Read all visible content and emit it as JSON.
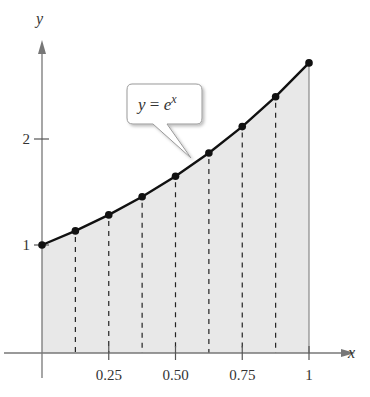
{
  "chart_data": {
    "type": "area",
    "title": "",
    "function_label": "y = e^x",
    "function_label_parts": {
      "lhs": "y",
      "eq": " = ",
      "base": "e",
      "exp": "x"
    },
    "xlabel": "x",
    "ylabel": "y",
    "x": [
      0,
      0.125,
      0.25,
      0.375,
      0.5,
      0.625,
      0.75,
      0.875,
      1
    ],
    "series": [
      {
        "name": "y = e^x",
        "values": [
          1,
          1.133,
          1.284,
          1.455,
          1.649,
          1.868,
          2.117,
          2.399,
          2.718
        ]
      }
    ],
    "x_ticks": [
      {
        "value": 0.25,
        "label": "0.25"
      },
      {
        "value": 0.5,
        "label": "0.50"
      },
      {
        "value": 0.75,
        "label": "0.75"
      },
      {
        "value": 1,
        "label": "1"
      }
    ],
    "y_ticks": [
      {
        "value": 1,
        "label": "1"
      },
      {
        "value": 2,
        "label": "2"
      }
    ],
    "xlim": [
      0,
      1
    ],
    "ylim": [
      0,
      2.718
    ],
    "grid": false,
    "shaded_region": {
      "from": 0,
      "to": 1,
      "color": "#e6e6e6"
    },
    "dashed_verticals": [
      0.125,
      0.25,
      0.375,
      0.5,
      0.625,
      0.75,
      0.875
    ],
    "colors": {
      "curve": "#111111",
      "axis": "#777777",
      "fill": "#e8e8e8",
      "callout_border": "#999999"
    }
  }
}
